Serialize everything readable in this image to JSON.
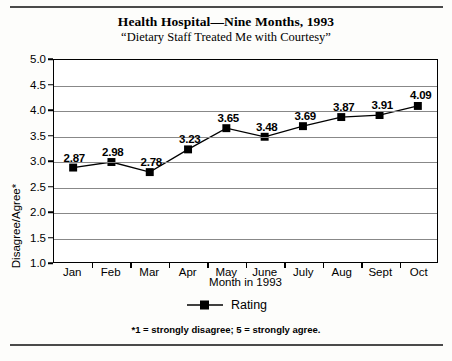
{
  "chart_data": {
    "type": "line",
    "title": "Health Hospital—Nine Months, 1993",
    "subtitle": "“Dietary Staff Treated Me with Courtesy”",
    "xlabel": "Month in 1993",
    "ylabel": "Disagree/Agree*",
    "categories": [
      "Jan",
      "Feb",
      "Mar",
      "Apr",
      "May",
      "June",
      "July",
      "Aug",
      "Sept",
      "Oct"
    ],
    "values": [
      2.87,
      2.98,
      2.78,
      3.23,
      3.65,
      3.48,
      3.69,
      3.87,
      3.91,
      4.09
    ],
    "point_labels": [
      "2.87",
      "2.98",
      "2.78",
      "3.23",
      "3.65",
      "3.48",
      "3.69",
      "3.87",
      "3.91",
      "4.09"
    ],
    "series": [
      {
        "name": "Rating",
        "values": [
          2.87,
          2.98,
          2.78,
          3.23,
          3.65,
          3.48,
          3.69,
          3.87,
          3.91,
          4.09
        ]
      }
    ],
    "ylim": [
      1.0,
      5.0
    ],
    "ytick_labels": [
      "5.0",
      "4.5",
      "4.0",
      "3.5",
      "3.0",
      "2.5",
      "2.0",
      "1.5",
      "1.0"
    ],
    "ytick_values": [
      5.0,
      4.5,
      4.0,
      3.5,
      3.0,
      2.5,
      2.0,
      1.5,
      1.0
    ],
    "grid": true,
    "legend_position": "bottom",
    "legend": [
      "Rating"
    ],
    "marker": "square",
    "line_color": "#000000",
    "marker_color": "#000000",
    "grid_color": "#888888",
    "annotations": [
      "*1 = strongly disagree; 5 = strongly agree."
    ]
  },
  "legend": {
    "rating_label": "Rating"
  },
  "footnote": {
    "text": "*1 = strongly disagree; 5 = strongly agree."
  }
}
